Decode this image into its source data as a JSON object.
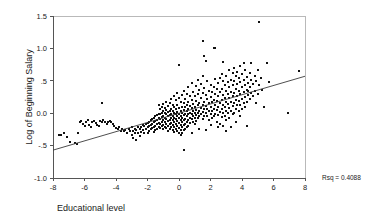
{
  "chart_data": {
    "type": "scatter",
    "title": "",
    "xlabel": "Educational level",
    "ylabel": "Log of Beginning Salary",
    "xlim": [
      -8,
      8
    ],
    "ylim": [
      -1.0,
      1.5
    ],
    "xticks": [
      -8,
      -6,
      -4,
      -2,
      0,
      2,
      4,
      6,
      8
    ],
    "xticklabels": [
      "-8",
      "-6",
      "-4",
      "-2",
      "0",
      "2",
      "4",
      "6",
      "8"
    ],
    "yticks": [
      -1.0,
      -0.5,
      0.0,
      0.5,
      1.0,
      1.5
    ],
    "yticklabels": [
      "-1.0",
      "-.5",
      "0.0",
      ".5",
      "1.0",
      "1.5"
    ],
    "grid": false,
    "legend": null,
    "annotations": [
      {
        "name": "rsq",
        "text": "Rsq = 0.4088",
        "x": 9.6,
        "y": -0.92
      }
    ],
    "fit_line": {
      "name": "linear-regression-line",
      "x": [
        -8,
        8
      ],
      "y": [
        -0.57,
        0.57
      ],
      "slope": 0.0713,
      "intercept": 0.0
    },
    "marker": {
      "shape": "square",
      "size_px": 2,
      "color": "#111111"
    },
    "points": [
      [
        -7.6,
        -0.34
      ],
      [
        -7.5,
        -0.33
      ],
      [
        -7.3,
        -0.3
      ],
      [
        -7.1,
        -0.36
      ],
      [
        -6.9,
        -0.44
      ],
      [
        -6.6,
        -0.46
      ],
      [
        -6.5,
        -0.48
      ],
      [
        -6.4,
        -0.31
      ],
      [
        -6.3,
        -0.13
      ],
      [
        -6.2,
        -0.12
      ],
      [
        -6.1,
        -0.16
      ],
      [
        -6.0,
        -0.19
      ],
      [
        -5.9,
        -0.14
      ],
      [
        -5.8,
        -0.11
      ],
      [
        -5.7,
        -0.18
      ],
      [
        -5.6,
        -0.22
      ],
      [
        -5.5,
        -0.13
      ],
      [
        -5.4,
        -0.12
      ],
      [
        -5.3,
        -0.15
      ],
      [
        -5.2,
        -0.18
      ],
      [
        -5.1,
        -0.19
      ],
      [
        -5.0,
        -0.12
      ],
      [
        -4.9,
        0.16
      ],
      [
        -4.9,
        -0.13
      ],
      [
        -4.8,
        -0.11
      ],
      [
        -4.7,
        -0.14
      ],
      [
        -4.6,
        -0.17
      ],
      [
        -4.5,
        -0.13
      ],
      [
        -4.4,
        -0.12
      ],
      [
        -4.3,
        -0.14
      ],
      [
        -4.2,
        -0.16
      ],
      [
        -4.1,
        -0.2
      ],
      [
        -4.0,
        -0.23
      ],
      [
        -3.9,
        -0.25
      ],
      [
        -3.8,
        -0.22
      ],
      [
        -3.7,
        -0.27
      ],
      [
        -3.6,
        -0.24
      ],
      [
        -3.5,
        -0.28
      ],
      [
        -3.4,
        -0.26
      ],
      [
        -3.3,
        -0.3
      ],
      [
        -3.2,
        -0.25
      ],
      [
        -3.1,
        -0.27
      ],
      [
        -3.0,
        -0.22
      ],
      [
        -3.0,
        -0.33
      ],
      [
        -2.9,
        -0.28
      ],
      [
        -2.9,
        -0.38
      ],
      [
        -2.8,
        -0.24
      ],
      [
        -2.8,
        -0.31
      ],
      [
        -2.7,
        -0.26
      ],
      [
        -2.7,
        -0.42
      ],
      [
        -2.6,
        -0.22
      ],
      [
        -2.6,
        -0.3
      ],
      [
        -2.5,
        -0.25
      ],
      [
        -2.5,
        -0.35
      ],
      [
        -2.4,
        -0.21
      ],
      [
        -2.4,
        -0.29
      ],
      [
        -2.3,
        -0.18
      ],
      [
        -2.3,
        -0.26
      ],
      [
        -2.2,
        -0.2
      ],
      [
        -2.2,
        -0.31
      ],
      [
        -2.1,
        -0.17
      ],
      [
        -2.1,
        -0.24
      ],
      [
        -2.0,
        -0.15
      ],
      [
        -2.0,
        -0.22
      ],
      [
        -2.0,
        -0.3
      ],
      [
        -1.9,
        -0.13
      ],
      [
        -1.9,
        -0.2
      ],
      [
        -1.9,
        -0.28
      ],
      [
        -1.8,
        -0.11
      ],
      [
        -1.8,
        -0.18
      ],
      [
        -1.8,
        -0.25
      ],
      [
        -1.7,
        -0.09
      ],
      [
        -1.7,
        -0.16
      ],
      [
        -1.7,
        -0.23
      ],
      [
        -1.6,
        -0.07
      ],
      [
        -1.6,
        -0.14
      ],
      [
        -1.6,
        -0.21
      ],
      [
        -1.6,
        -0.29
      ],
      [
        -1.5,
        -0.05
      ],
      [
        -1.5,
        -0.12
      ],
      [
        -1.5,
        -0.19
      ],
      [
        -1.5,
        -0.26
      ],
      [
        -1.4,
        -0.03
      ],
      [
        -1.4,
        -0.1
      ],
      [
        -1.4,
        -0.17
      ],
      [
        -1.4,
        -0.24
      ],
      [
        -1.3,
        0.12
      ],
      [
        -1.3,
        -0.01
      ],
      [
        -1.3,
        -0.08
      ],
      [
        -1.3,
        -0.15
      ],
      [
        -1.3,
        -0.22
      ],
      [
        -1.2,
        0.06
      ],
      [
        -1.2,
        -0.02
      ],
      [
        -1.2,
        -0.09
      ],
      [
        -1.2,
        -0.16
      ],
      [
        -1.2,
        -0.23
      ],
      [
        -1.1,
        0.1
      ],
      [
        -1.1,
        0.01
      ],
      [
        -1.1,
        -0.06
      ],
      [
        -1.1,
        -0.13
      ],
      [
        -1.1,
        -0.2
      ],
      [
        -1.0,
        0.14
      ],
      [
        -1.0,
        0.03
      ],
      [
        -1.0,
        -0.04
      ],
      [
        -1.0,
        -0.11
      ],
      [
        -1.0,
        -0.18
      ],
      [
        -1.0,
        -0.25
      ],
      [
        -0.9,
        0.08
      ],
      [
        -0.9,
        0.0
      ],
      [
        -0.9,
        -0.07
      ],
      [
        -0.9,
        -0.14
      ],
      [
        -0.9,
        -0.21
      ],
      [
        -0.8,
        0.18
      ],
      [
        -0.8,
        0.05
      ],
      [
        -0.8,
        -0.02
      ],
      [
        -0.8,
        -0.09
      ],
      [
        -0.8,
        -0.16
      ],
      [
        -0.8,
        -0.23
      ],
      [
        -0.7,
        0.11
      ],
      [
        -0.7,
        0.02
      ],
      [
        -0.7,
        -0.05
      ],
      [
        -0.7,
        -0.12
      ],
      [
        -0.7,
        -0.19
      ],
      [
        -0.7,
        -0.27
      ],
      [
        -0.6,
        0.16
      ],
      [
        -0.6,
        0.04
      ],
      [
        -0.6,
        -0.03
      ],
      [
        -0.6,
        -0.1
      ],
      [
        -0.6,
        -0.17
      ],
      [
        -0.6,
        -0.24
      ],
      [
        -0.5,
        0.22
      ],
      [
        -0.5,
        0.07
      ],
      [
        -0.5,
        -0.01
      ],
      [
        -0.5,
        -0.08
      ],
      [
        -0.5,
        -0.15
      ],
      [
        -0.5,
        -0.22
      ],
      [
        -0.4,
        0.13
      ],
      [
        -0.4,
        0.03
      ],
      [
        -0.4,
        -0.04
      ],
      [
        -0.4,
        -0.11
      ],
      [
        -0.4,
        -0.18
      ],
      [
        -0.4,
        -0.26
      ],
      [
        -0.3,
        0.26
      ],
      [
        -0.3,
        0.09
      ],
      [
        -0.3,
        0.0
      ],
      [
        -0.3,
        -0.07
      ],
      [
        -0.3,
        -0.14
      ],
      [
        -0.3,
        -0.21
      ],
      [
        -0.3,
        -0.29
      ],
      [
        -0.2,
        0.2
      ],
      [
        -0.2,
        0.06
      ],
      [
        -0.2,
        -0.02
      ],
      [
        -0.2,
        -0.09
      ],
      [
        -0.2,
        -0.16
      ],
      [
        -0.2,
        -0.24
      ],
      [
        -0.1,
        0.31
      ],
      [
        -0.1,
        0.12
      ],
      [
        -0.1,
        0.02
      ],
      [
        -0.1,
        -0.05
      ],
      [
        -0.1,
        -0.12
      ],
      [
        -0.1,
        -0.2
      ],
      [
        -0.1,
        -0.28
      ],
      [
        0.0,
        0.75
      ],
      [
        0.0,
        0.24
      ],
      [
        0.0,
        0.08
      ],
      [
        0.0,
        -0.01
      ],
      [
        0.0,
        -0.08
      ],
      [
        0.0,
        -0.15
      ],
      [
        0.0,
        -0.23
      ],
      [
        0.0,
        -0.31
      ],
      [
        0.1,
        0.17
      ],
      [
        0.1,
        0.04
      ],
      [
        0.1,
        -0.04
      ],
      [
        0.1,
        -0.11
      ],
      [
        0.1,
        -0.18
      ],
      [
        0.1,
        -0.26
      ],
      [
        0.1,
        -0.34
      ],
      [
        0.2,
        0.28
      ],
      [
        0.2,
        0.1
      ],
      [
        0.2,
        0.0
      ],
      [
        0.2,
        -0.07
      ],
      [
        0.2,
        -0.14
      ],
      [
        0.2,
        -0.22
      ],
      [
        0.2,
        -0.3
      ],
      [
        0.3,
        0.34
      ],
      [
        0.3,
        0.15
      ],
      [
        0.3,
        0.05
      ],
      [
        0.3,
        -0.03
      ],
      [
        0.3,
        -0.1
      ],
      [
        0.3,
        -0.18
      ],
      [
        0.3,
        -0.26
      ],
      [
        0.3,
        -0.57
      ],
      [
        0.4,
        0.22
      ],
      [
        0.4,
        0.09
      ],
      [
        0.4,
        -0.01
      ],
      [
        0.4,
        -0.09
      ],
      [
        0.4,
        -0.17
      ],
      [
        0.4,
        -0.25
      ],
      [
        0.5,
        0.3
      ],
      [
        0.5,
        0.13
      ],
      [
        0.5,
        0.03
      ],
      [
        0.5,
        -0.05
      ],
      [
        0.5,
        -0.13
      ],
      [
        0.5,
        -0.22
      ],
      [
        0.6,
        0.4
      ],
      [
        0.6,
        0.18
      ],
      [
        0.6,
        0.06
      ],
      [
        0.6,
        -0.02
      ],
      [
        0.6,
        -0.1
      ],
      [
        0.6,
        -0.19
      ],
      [
        0.7,
        0.26
      ],
      [
        0.7,
        0.11
      ],
      [
        0.7,
        0.01
      ],
      [
        0.7,
        -0.07
      ],
      [
        0.7,
        -0.15
      ],
      [
        0.8,
        0.47
      ],
      [
        0.8,
        0.21
      ],
      [
        0.8,
        0.08
      ],
      [
        0.8,
        -0.01
      ],
      [
        0.8,
        -0.09
      ],
      [
        0.8,
        -0.31
      ],
      [
        0.9,
        0.33
      ],
      [
        0.9,
        0.14
      ],
      [
        0.9,
        0.03
      ],
      [
        0.9,
        -0.05
      ],
      [
        0.9,
        -0.13
      ],
      [
        1.0,
        0.27
      ],
      [
        1.0,
        0.1
      ],
      [
        1.0,
        0.0
      ],
      [
        1.0,
        -0.08
      ],
      [
        1.0,
        -0.17
      ],
      [
        1.1,
        0.42
      ],
      [
        1.1,
        0.19
      ],
      [
        1.1,
        0.05
      ],
      [
        1.1,
        -0.03
      ],
      [
        1.1,
        -0.12
      ],
      [
        1.2,
        0.52
      ],
      [
        1.2,
        0.3
      ],
      [
        1.2,
        0.12
      ],
      [
        1.2,
        0.01
      ],
      [
        1.2,
        -0.07
      ],
      [
        1.3,
        0.36
      ],
      [
        1.3,
        0.16
      ],
      [
        1.3,
        0.04
      ],
      [
        1.3,
        -0.04
      ],
      [
        1.3,
        -0.24
      ],
      [
        1.4,
        0.45
      ],
      [
        1.4,
        0.23
      ],
      [
        1.4,
        0.08
      ],
      [
        1.4,
        -0.02
      ],
      [
        1.5,
        1.12
      ],
      [
        1.5,
        0.58
      ],
      [
        1.5,
        0.31
      ],
      [
        1.5,
        0.13
      ],
      [
        1.5,
        0.02
      ],
      [
        1.5,
        -0.09
      ],
      [
        1.6,
        0.89
      ],
      [
        1.6,
        0.39
      ],
      [
        1.6,
        0.18
      ],
      [
        1.6,
        0.06
      ],
      [
        1.6,
        -0.05
      ],
      [
        1.7,
        0.8
      ],
      [
        1.7,
        0.28
      ],
      [
        1.7,
        0.11
      ],
      [
        1.7,
        0.0
      ],
      [
        1.7,
        -0.26
      ],
      [
        1.8,
        0.5
      ],
      [
        1.8,
        0.22
      ],
      [
        1.8,
        0.07
      ],
      [
        1.8,
        -0.04
      ],
      [
        1.9,
        0.35
      ],
      [
        1.9,
        0.15
      ],
      [
        1.9,
        0.03
      ],
      [
        1.9,
        -0.11
      ],
      [
        2.0,
        0.44
      ],
      [
        2.0,
        0.25
      ],
      [
        2.0,
        0.09
      ],
      [
        2.0,
        -0.02
      ],
      [
        2.0,
        -0.18
      ],
      [
        2.1,
        0.33
      ],
      [
        2.1,
        0.17
      ],
      [
        2.1,
        0.04
      ],
      [
        2.1,
        -0.08
      ],
      [
        2.2,
        1.0
      ],
      [
        2.2,
        0.41
      ],
      [
        2.2,
        0.21
      ],
      [
        2.2,
        0.06
      ],
      [
        2.2,
        -0.05
      ],
      [
        2.3,
        1.0
      ],
      [
        2.3,
        0.53
      ],
      [
        2.3,
        0.29
      ],
      [
        2.3,
        0.12
      ],
      [
        2.3,
        -0.01
      ],
      [
        2.4,
        0.37
      ],
      [
        2.4,
        0.19
      ],
      [
        2.4,
        0.05
      ],
      [
        2.4,
        -0.13
      ],
      [
        2.5,
        0.46
      ],
      [
        2.5,
        0.26
      ],
      [
        2.5,
        0.1
      ],
      [
        2.5,
        -0.03
      ],
      [
        2.5,
        -0.22
      ],
      [
        2.6,
        0.55
      ],
      [
        2.6,
        0.32
      ],
      [
        2.6,
        0.15
      ],
      [
        2.6,
        0.02
      ],
      [
        2.6,
        -0.16
      ],
      [
        2.7,
        0.6
      ],
      [
        2.7,
        0.38
      ],
      [
        2.7,
        0.2
      ],
      [
        2.7,
        0.07
      ],
      [
        2.7,
        -0.06
      ],
      [
        2.8,
        0.79
      ],
      [
        2.8,
        0.49
      ],
      [
        2.8,
        0.28
      ],
      [
        2.8,
        0.13
      ],
      [
        2.8,
        0.0
      ],
      [
        2.8,
        -0.19
      ],
      [
        2.9,
        0.43
      ],
      [
        2.9,
        0.24
      ],
      [
        2.9,
        0.09
      ],
      [
        2.9,
        -0.04
      ],
      [
        3.0,
        0.57
      ],
      [
        3.0,
        0.35
      ],
      [
        3.0,
        0.18
      ],
      [
        3.0,
        0.04
      ],
      [
        3.0,
        -0.1
      ],
      [
        3.0,
        -0.27
      ],
      [
        3.1,
        0.48
      ],
      [
        3.1,
        0.3
      ],
      [
        3.1,
        0.14
      ],
      [
        3.1,
        0.01
      ],
      [
        3.2,
        0.66
      ],
      [
        3.2,
        0.4
      ],
      [
        3.2,
        0.23
      ],
      [
        3.2,
        0.08
      ],
      [
        3.2,
        -0.08
      ],
      [
        3.3,
        0.52
      ],
      [
        3.3,
        0.33
      ],
      [
        3.3,
        0.17
      ],
      [
        3.3,
        0.03
      ],
      [
        3.3,
        -0.21
      ],
      [
        3.4,
        0.62
      ],
      [
        3.4,
        0.44
      ],
      [
        3.4,
        0.26
      ],
      [
        3.4,
        0.11
      ],
      [
        3.4,
        -0.02
      ],
      [
        3.5,
        0.7
      ],
      [
        3.5,
        0.5
      ],
      [
        3.5,
        0.31
      ],
      [
        3.5,
        0.15
      ],
      [
        3.5,
        0.0
      ],
      [
        3.6,
        0.58
      ],
      [
        3.6,
        0.38
      ],
      [
        3.6,
        0.21
      ],
      [
        3.6,
        0.06
      ],
      [
        3.6,
        -0.14
      ],
      [
        3.7,
        0.64
      ],
      [
        3.7,
        0.45
      ],
      [
        3.7,
        0.27
      ],
      [
        3.7,
        0.12
      ],
      [
        3.8,
        0.54
      ],
      [
        3.8,
        0.35
      ],
      [
        3.8,
        0.19
      ],
      [
        3.8,
        0.04
      ],
      [
        3.9,
        0.73
      ],
      [
        3.9,
        0.48
      ],
      [
        3.9,
        0.29
      ],
      [
        3.9,
        0.13
      ],
      [
        3.9,
        -0.05
      ],
      [
        4.0,
        0.6
      ],
      [
        4.0,
        0.4
      ],
      [
        4.0,
        0.22
      ],
      [
        4.0,
        0.07
      ],
      [
        4.1,
        0.78
      ],
      [
        4.1,
        0.51
      ],
      [
        4.1,
        0.32
      ],
      [
        4.1,
        0.16
      ],
      [
        4.2,
        0.66
      ],
      [
        4.2,
        0.43
      ],
      [
        4.2,
        0.25
      ],
      [
        4.2,
        0.09
      ],
      [
        4.3,
        0.56
      ],
      [
        4.3,
        0.36
      ],
      [
        4.3,
        0.18
      ],
      [
        4.3,
        -0.2
      ],
      [
        4.4,
        0.47
      ],
      [
        4.4,
        0.28
      ],
      [
        4.4,
        0.35
      ],
      [
        4.5,
        0.62
      ],
      [
        4.5,
        0.4
      ],
      [
        4.5,
        0.22
      ],
      [
        4.6,
        0.77
      ],
      [
        4.6,
        0.52
      ],
      [
        4.6,
        0.31
      ],
      [
        4.7,
        0.45
      ],
      [
        4.7,
        0.26
      ],
      [
        4.8,
        0.58
      ],
      [
        4.8,
        0.35
      ],
      [
        4.9,
        0.49
      ],
      [
        4.9,
        0.15
      ],
      [
        5.0,
        0.66
      ],
      [
        5.0,
        0.3
      ],
      [
        5.1,
        1.4
      ],
      [
        5.1,
        0.43
      ],
      [
        5.2,
        0.55
      ],
      [
        5.3,
        0.36
      ],
      [
        5.4,
        0.1
      ],
      [
        5.6,
        0.77
      ],
      [
        5.7,
        0.48
      ],
      [
        6.9,
        0.01
      ],
      [
        7.6,
        0.65
      ]
    ]
  }
}
